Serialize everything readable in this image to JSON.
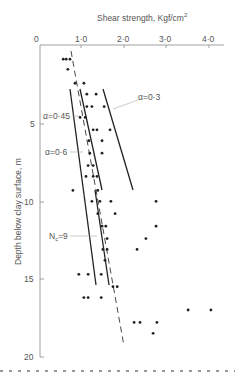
{
  "chart_data": {
    "type": "scatter",
    "title": "",
    "xlabel": "Shear strength,  Kgf/cm²",
    "xlabel_text": "Shear strength,  Kgf/cm",
    "xlabel_sup": "2",
    "ylabel": "Depth below clay surface,  m",
    "x_axis_position": "top",
    "y_axis_inverted": true,
    "xlim": [
      0,
      4.0
    ],
    "ylim": [
      0,
      20
    ],
    "xticks": [
      "0",
      "1·0",
      "2·0",
      "3·0",
      "4·0"
    ],
    "xtick_values": [
      0,
      1.0,
      2.0,
      3.0,
      4.0
    ],
    "yticks": [
      "5",
      "10",
      "15",
      "20"
    ],
    "ytick_values": [
      5,
      10,
      15,
      20
    ],
    "grid": false,
    "points": [
      {
        "x": 0.55,
        "y": 0.85
      },
      {
        "x": 0.62,
        "y": 0.85
      },
      {
        "x": 0.71,
        "y": 0.85
      },
      {
        "x": 0.66,
        "y": 1.5
      },
      {
        "x": 0.83,
        "y": 2.4
      },
      {
        "x": 1.04,
        "y": 2.4
      },
      {
        "x": 1.11,
        "y": 3.1
      },
      {
        "x": 1.33,
        "y": 3.1
      },
      {
        "x": 1.11,
        "y": 3.9
      },
      {
        "x": 1.23,
        "y": 3.9
      },
      {
        "x": 1.52,
        "y": 3.9
      },
      {
        "x": 0.95,
        "y": 4.6
      },
      {
        "x": 1.07,
        "y": 4.6
      },
      {
        "x": 1.26,
        "y": 5.4
      },
      {
        "x": 1.35,
        "y": 5.4
      },
      {
        "x": 1.66,
        "y": 5.4
      },
      {
        "x": 1.16,
        "y": 6.1
      },
      {
        "x": 1.47,
        "y": 6.1
      },
      {
        "x": 1.18,
        "y": 6.9
      },
      {
        "x": 1.47,
        "y": 6.9
      },
      {
        "x": 1.14,
        "y": 7.7
      },
      {
        "x": 1.26,
        "y": 7.7
      },
      {
        "x": 1.09,
        "y": 8.4
      },
      {
        "x": 1.26,
        "y": 8.4
      },
      {
        "x": 1.35,
        "y": 8.4
      },
      {
        "x": 0.78,
        "y": 9.3
      },
      {
        "x": 1.37,
        "y": 9.3
      },
      {
        "x": 1.23,
        "y": 10.0
      },
      {
        "x": 1.42,
        "y": 10.0
      },
      {
        "x": 1.68,
        "y": 10.0
      },
      {
        "x": 2.75,
        "y": 10.0
      },
      {
        "x": 1.37,
        "y": 10.8
      },
      {
        "x": 1.78,
        "y": 10.8
      },
      {
        "x": 1.47,
        "y": 11.6
      },
      {
        "x": 1.56,
        "y": 11.6
      },
      {
        "x": 2.75,
        "y": 11.6
      },
      {
        "x": 1.59,
        "y": 12.4
      },
      {
        "x": 2.51,
        "y": 12.4
      },
      {
        "x": 1.49,
        "y": 13.1
      },
      {
        "x": 1.59,
        "y": 13.1
      },
      {
        "x": 2.3,
        "y": 13.1
      },
      {
        "x": 1.54,
        "y": 13.8
      },
      {
        "x": 0.92,
        "y": 14.7
      },
      {
        "x": 1.14,
        "y": 14.7
      },
      {
        "x": 1.45,
        "y": 14.7
      },
      {
        "x": 1.73,
        "y": 15.5
      },
      {
        "x": 1.83,
        "y": 15.5
      },
      {
        "x": 1.04,
        "y": 16.2
      },
      {
        "x": 1.14,
        "y": 16.2
      },
      {
        "x": 1.45,
        "y": 16.2
      },
      {
        "x": 3.51,
        "y": 17.0
      },
      {
        "x": 4.05,
        "y": 17.0
      },
      {
        "x": 2.23,
        "y": 17.8
      },
      {
        "x": 2.37,
        "y": 17.8
      },
      {
        "x": 2.77,
        "y": 17.8
      },
      {
        "x": 2.68,
        "y": 18.5
      }
    ],
    "lines": [
      {
        "name": "α=0·45",
        "style": "solid",
        "x": [
          0.71,
          1.33
        ],
        "y": [
          2.8,
          15.4
        ]
      },
      {
        "name": "α=0·6",
        "style": "solid",
        "x": [
          0.95,
          1.47
        ],
        "y": [
          2.8,
          9.3
        ]
      },
      {
        "name": "α=0·3",
        "style": "solid",
        "x": [
          1.49,
          2.2
        ],
        "y": [
          2.8,
          9.3
        ]
      },
      {
        "name": "Nc=9",
        "style": "solid",
        "x": [
          1.3,
          1.64
        ],
        "y": [
          9.3,
          15.4
        ]
      },
      {
        "name": "mean",
        "style": "dashed",
        "x": [
          0.73,
          2.0
        ],
        "y": [
          0.3,
          19.3
        ]
      }
    ],
    "annotations": [
      {
        "text": "α=0·45",
        "x": 0.15,
        "y": 5.4
      },
      {
        "text": "α=0·6",
        "x": 0.15,
        "y": 7.4
      },
      {
        "text": "α=0·3",
        "x": 2.5,
        "y": 3.5
      },
      {
        "text": "Nc=9",
        "x": 0.4,
        "y": 12.1
      }
    ]
  },
  "labels": {
    "x_title": "Shear strength,  Kgf/cm",
    "x_title_sup": "2",
    "y_title": "Depth below clay surface,  m",
    "x0": "0",
    "x1": "1·0",
    "x2": "2·0",
    "x3": "3·0",
    "x4": "4·0",
    "y5": "5",
    "y10": "10",
    "y15": "15",
    "y20": "20",
    "a045": "α=0·45",
    "a06": "α=0·6",
    "a03": "α=0·3",
    "nc": "N",
    "nc_sub": "c",
    "nc_val": "=9"
  },
  "colors": {
    "ink": "#222222",
    "axis": "#777777",
    "text": "#555555"
  }
}
